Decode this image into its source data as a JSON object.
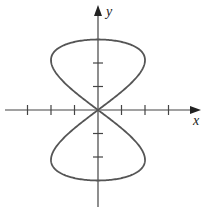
{
  "chart_data": {
    "type": "line",
    "title": "",
    "xlabel": "x",
    "ylabel": "y",
    "xlim": [
      -4.2,
      4.4
    ],
    "ylim": [
      -4.2,
      4.5
    ],
    "x_ticks": [
      -3,
      -2,
      -1,
      1,
      2,
      3
    ],
    "y_ticks": [
      -2,
      -1,
      1,
      2
    ],
    "grid": false,
    "series": [
      {
        "name": "curve",
        "color": "#555555",
        "x_eq": "2*sin(2t)",
        "y_eq": "3*sin(t)",
        "t_range": [
          0,
          6.2832
        ]
      }
    ]
  },
  "labels": {
    "x": "x",
    "y": "y"
  }
}
